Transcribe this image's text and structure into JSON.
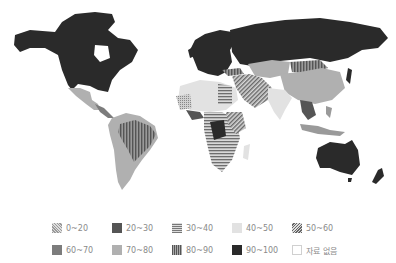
{
  "map": {
    "type": "choropleth",
    "region": "world",
    "regions": [
      {
        "name": "North America (USA/Canada)",
        "class": "90-100"
      },
      {
        "name": "Mexico",
        "class": "70-80"
      },
      {
        "name": "Central America",
        "class": "60-70"
      },
      {
        "name": "Brazil",
        "class": "80-90"
      },
      {
        "name": "South America (other)",
        "class": "70-80"
      },
      {
        "name": "Europe",
        "class": "90-100"
      },
      {
        "name": "Russia",
        "class": "90-100"
      },
      {
        "name": "China",
        "class": "70-80"
      },
      {
        "name": "Mongolia",
        "class": "80-90"
      },
      {
        "name": "Kazakhstan",
        "class": "70-80"
      },
      {
        "name": "India",
        "class": "40-50"
      },
      {
        "name": "Middle East",
        "class": "50-60"
      },
      {
        "name": "North Africa",
        "class": "30-40"
      },
      {
        "name": "Central Africa (DRC)",
        "class": "20-30"
      },
      {
        "name": "Southern Africa",
        "class": "30-40"
      },
      {
        "name": "West Africa",
        "class": "0-20"
      },
      {
        "name": "Southeast Asia",
        "class": "60-70"
      },
      {
        "name": "Australia",
        "class": "90-100"
      },
      {
        "name": "New Zealand",
        "class": "90-100"
      },
      {
        "name": "Greenland",
        "class": "no-data"
      }
    ]
  },
  "legend": {
    "rows": [
      [
        {
          "label": "0~20",
          "pattern": "dots",
          "color": "#b8b8b8"
        },
        {
          "label": "20~30",
          "pattern": "solid",
          "color": "#555555"
        },
        {
          "label": "30~40",
          "pattern": "hstripes",
          "color": "#8a8a8a"
        },
        {
          "label": "40~50",
          "pattern": "solid",
          "color": "#e2e2e2"
        },
        {
          "label": "50~60",
          "pattern": "diagonal",
          "color": "#7a7a7a"
        }
      ],
      [
        {
          "label": "60~70",
          "pattern": "solid",
          "color": "#7c7c7c"
        },
        {
          "label": "70~80",
          "pattern": "solid",
          "color": "#b0b0b0"
        },
        {
          "label": "80~90",
          "pattern": "vstripes",
          "color": "#666666"
        },
        {
          "label": "90~100",
          "pattern": "solid",
          "color": "#2a2a2a"
        },
        {
          "label": "자료 없음",
          "pattern": "empty",
          "color": "#ffffff"
        }
      ]
    ]
  }
}
